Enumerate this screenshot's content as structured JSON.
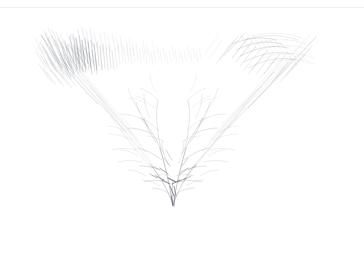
{
  "artwork": {
    "title": "Bird with outstretched wings",
    "medium": "graphite pencil sketch",
    "support": "white paper",
    "orientation": "landscape",
    "canvas": {
      "width": 364,
      "height": 278,
      "background_color": "#ffffff"
    },
    "subject": "V-shaped bird in flight, wings spread upward, body converging to a dark point at the bottom",
    "composition": {
      "apex_point": {
        "x": 173,
        "y": 206
      },
      "left_wing_tip": {
        "x": 40,
        "y": 34
      },
      "right_wing_tip": {
        "x": 316,
        "y": 36
      },
      "negative_space": "lower third and outer margins left blank"
    },
    "tone": {
      "lightest_stroke_color": "#e8e9ec",
      "mid_stroke_color": "#9ea3ac",
      "darkest_stroke_color": "#555a62",
      "overall_value": "very light / high key"
    }
  },
  "decor": {
    "top_rule_color": "#f0f1f3"
  },
  "faint_marks": [
    {
      "text": "· ····",
      "x": 66,
      "y": 23
    },
    {
      "text": "·· ··· ·",
      "x": 118,
      "y": 23
    }
  ],
  "stroke_groups": [
    {
      "name": "left-wing-hatching",
      "description": "dense short diagonal hatch strokes along the upper left wing",
      "stroke_count": 54,
      "color": "#8c919a"
    },
    {
      "name": "upper-crest-hatching",
      "description": "dense vertical and near-vertical hatching across the top center",
      "stroke_count": 72,
      "color": "#7e838c"
    },
    {
      "name": "right-wing-feathers",
      "description": "long sweeping diagonal feather strokes on the right wing",
      "stroke_count": 46,
      "color": "#9aa0a8"
    },
    {
      "name": "left-wing-contour",
      "description": "long descending contour lines from left wing tip toward the body",
      "stroke_count": 14,
      "color": "#b2b7be"
    },
    {
      "name": "right-wing-contour",
      "description": "long descending contour lines from right wing tip toward the body",
      "stroke_count": 14,
      "color": "#b2b7be"
    },
    {
      "name": "body-branching",
      "description": "branching twig-like strokes forming the breast and tail converging at the apex",
      "stroke_count": 62,
      "color": "#6d727b"
    },
    {
      "name": "apex-accents",
      "description": "darkest short accent marks clustered at the convergence point",
      "stroke_count": 18,
      "color": "#555a62"
    }
  ]
}
